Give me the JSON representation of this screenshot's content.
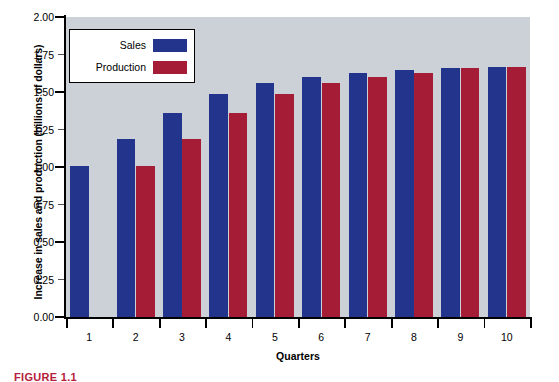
{
  "chart_data": {
    "type": "bar",
    "title": "",
    "xlabel": "Quarters",
    "ylabel": "Increase in sales and production (billions of dollars)",
    "categories": [
      "1",
      "2",
      "3",
      "4",
      "5",
      "6",
      "7",
      "8",
      "9",
      "10"
    ],
    "series": [
      {
        "name": "Sales",
        "color": "#22348c",
        "values": [
          1.01,
          1.19,
          1.36,
          1.49,
          1.56,
          1.6,
          1.63,
          1.65,
          1.66,
          1.67
        ]
      },
      {
        "name": "Production",
        "color": "#a51c36",
        "values": [
          null,
          1.01,
          1.19,
          1.36,
          1.49,
          1.56,
          1.6,
          1.63,
          1.66,
          1.67
        ]
      }
    ],
    "ylim": [
      0.0,
      2.0
    ],
    "ytick_values": [
      0.0,
      0.25,
      0.5,
      0.75,
      1.0,
      1.25,
      1.5,
      1.75,
      2.0
    ],
    "ytick_labels": [
      "0.00",
      "0.25",
      "0.50",
      "0.75",
      "1.00",
      "1.25",
      "1.50",
      "1.75",
      "2.00"
    ],
    "grid": false,
    "legend_position": "upper left",
    "plot_background": "#ccd0d7"
  },
  "legend": {
    "entries": [
      {
        "label": "Sales",
        "color": "#22348c"
      },
      {
        "label": "Production",
        "color": "#a51c36"
      }
    ]
  },
  "caption": {
    "text": "FIGURE 1.1",
    "color": "#b5213a"
  }
}
